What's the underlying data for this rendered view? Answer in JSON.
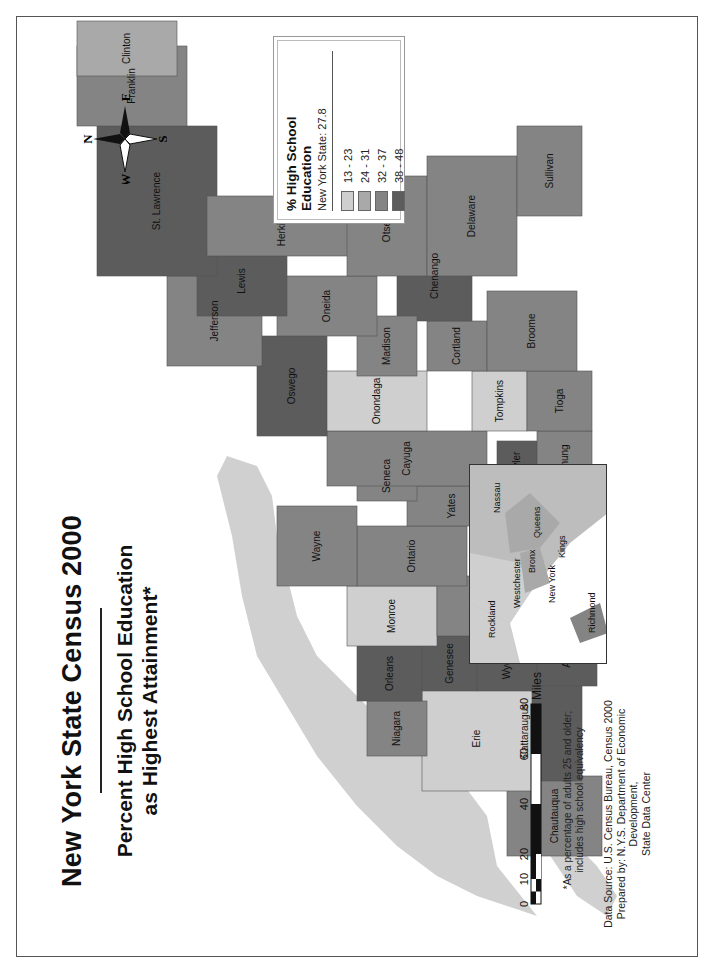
{
  "title": "New York State Census 2000",
  "subtitle_line1": "Percent High School Education",
  "subtitle_line2": "as Highest Attainment*",
  "legend": {
    "title": "% High School Education",
    "state_value_label": "New York State: 27.8",
    "classes": [
      {
        "range": "13 - 23",
        "color": "#cfcfcf"
      },
      {
        "range": "24 - 31",
        "color": "#a9a9a9"
      },
      {
        "range": "32 - 37",
        "color": "#848484"
      },
      {
        "range": "38 - 48",
        "color": "#5c5c5c"
      }
    ]
  },
  "compass": {
    "north": "N",
    "south": "S",
    "east": "E",
    "west": "W"
  },
  "scale_bar": {
    "ticks": [
      "0",
      "10",
      "20",
      "40",
      "60",
      "80"
    ],
    "unit": "Miles"
  },
  "footnote_line1": "*As a percentage of adults 25 and older;",
  "footnote_line2": "includes high school equivalency",
  "source_line1": "Data Source: U.S. Census Bureau, Census 2000",
  "source_line2": "Prepared by: N.Y.S. Department of Economic Development,",
  "source_line3": "State Data Center",
  "chart_data": {
    "type": "choropleth",
    "state_average": 27.8,
    "classes": [
      "13 - 23",
      "24 - 31",
      "32 - 37",
      "38 - 48"
    ],
    "counties": [
      {
        "name": "Clinton",
        "class": "24 - 31"
      },
      {
        "name": "Franklin",
        "class": "32 - 37"
      },
      {
        "name": "St. Lawrence",
        "class": "38 - 48"
      },
      {
        "name": "Essex",
        "class": "38 - 48"
      },
      {
        "name": "Washington",
        "class": "38 - 48"
      },
      {
        "name": "Warren",
        "class": "32 - 37"
      },
      {
        "name": "Hamilton",
        "class": "32 - 37"
      },
      {
        "name": "Saratoga",
        "class": "13 - 23"
      },
      {
        "name": "Fulton",
        "class": "38 - 48"
      },
      {
        "name": "Herkimer",
        "class": "32 - 37"
      },
      {
        "name": "Montgomery",
        "class": "38 - 48"
      },
      {
        "name": "Schenectady",
        "class": "24 - 31"
      },
      {
        "name": "Rensselaer",
        "class": "32 - 37"
      },
      {
        "name": "Albany",
        "class": "13 - 23"
      },
      {
        "name": "Columbia",
        "class": "32 - 37"
      },
      {
        "name": "Greene",
        "class": "32 - 37"
      },
      {
        "name": "Schoharie",
        "class": "38 - 48"
      },
      {
        "name": "Otsego",
        "class": "32 - 37"
      },
      {
        "name": "Delaware",
        "class": "32 - 37"
      },
      {
        "name": "Ulster",
        "class": "24 - 31"
      },
      {
        "name": "Dutchess",
        "class": "24 - 31"
      },
      {
        "name": "Sullivan",
        "class": "32 - 37"
      },
      {
        "name": "Orange",
        "class": "24 - 31"
      },
      {
        "name": "Putnam",
        "class": "24 - 31"
      },
      {
        "name": "Rockland",
        "class": "13 - 23"
      },
      {
        "name": "Westchester",
        "class": "13 - 23"
      },
      {
        "name": "Nassau",
        "class": "24 - 31"
      },
      {
        "name": "Suffolk",
        "class": "24 - 31"
      },
      {
        "name": "Bronx",
        "class": "24 - 31"
      },
      {
        "name": "New York",
        "class": "13 - 23"
      },
      {
        "name": "Queens",
        "class": "24 - 31"
      },
      {
        "name": "Kings",
        "class": "24 - 31"
      },
      {
        "name": "Richmond",
        "class": "32 - 37"
      },
      {
        "name": "Jefferson",
        "class": "32 - 37"
      },
      {
        "name": "Lewis",
        "class": "38 - 48"
      },
      {
        "name": "Oneida",
        "class": "32 - 37"
      },
      {
        "name": "Madison",
        "class": "32 - 37"
      },
      {
        "name": "Chenango",
        "class": "38 - 48"
      },
      {
        "name": "Broome",
        "class": "32 - 37"
      },
      {
        "name": "Oswego",
        "class": "38 - 48"
      },
      {
        "name": "Onondaga",
        "class": "13 - 23"
      },
      {
        "name": "Cortland",
        "class": "32 - 37"
      },
      {
        "name": "Cayuga",
        "class": "32 - 37"
      },
      {
        "name": "Tompkins",
        "class": "13 - 23"
      },
      {
        "name": "Tioga",
        "class": "32 - 37"
      },
      {
        "name": "Seneca",
        "class": "32 - 37"
      },
      {
        "name": "Schuyler",
        "class": "38 - 48"
      },
      {
        "name": "Chemung",
        "class": "32 - 37"
      },
      {
        "name": "Wayne",
        "class": "32 - 37"
      },
      {
        "name": "Ontario",
        "class": "32 - 37"
      },
      {
        "name": "Yates",
        "class": "32 - 37"
      },
      {
        "name": "Steuben",
        "class": "32 - 37"
      },
      {
        "name": "Monroe",
        "class": "13 - 23"
      },
      {
        "name": "Livingston",
        "class": "32 - 37"
      },
      {
        "name": "Orleans",
        "class": "38 - 48"
      },
      {
        "name": "Genesee",
        "class": "38 - 48"
      },
      {
        "name": "Wyoming",
        "class": "38 - 48"
      },
      {
        "name": "Allegany",
        "class": "38 - 48"
      },
      {
        "name": "Niagara",
        "class": "32 - 37"
      },
      {
        "name": "Erie",
        "class": "13 - 23"
      },
      {
        "name": "Cattaraugus",
        "class": "38 - 48"
      },
      {
        "name": "Chautauqua",
        "class": "32 - 37"
      }
    ],
    "inset": {
      "counties": [
        "Rockland",
        "Westchester",
        "Bronx",
        "New York",
        "Queens",
        "Kings",
        "Richmond",
        "Nassau"
      ]
    },
    "scale_miles": [
      0,
      10,
      20,
      40,
      60,
      80
    ]
  }
}
